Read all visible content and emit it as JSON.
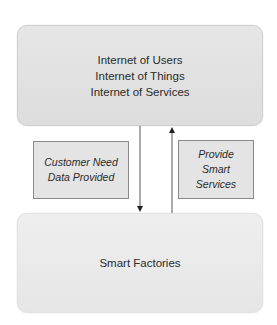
{
  "diagram": {
    "top_box": {
      "lines": [
        "Internet of Users",
        "Internet of Things",
        "Internet of Services"
      ]
    },
    "bottom_box": {
      "label": "Smart Factories"
    },
    "left_label": {
      "lines": [
        "Customer Need",
        "Data Provided"
      ]
    },
    "right_label": {
      "lines": [
        "Provide",
        "Smart",
        "Services"
      ]
    },
    "arrows": [
      {
        "direction": "down",
        "from": "top_box",
        "to": "bottom_box",
        "label_ref": "left_label"
      },
      {
        "direction": "up",
        "from": "bottom_box",
        "to": "top_box",
        "label_ref": "right_label"
      }
    ],
    "colors": {
      "box_fill": "#e2e2e2",
      "label_border": "#8a8a8a",
      "arrow": "#333333"
    }
  }
}
